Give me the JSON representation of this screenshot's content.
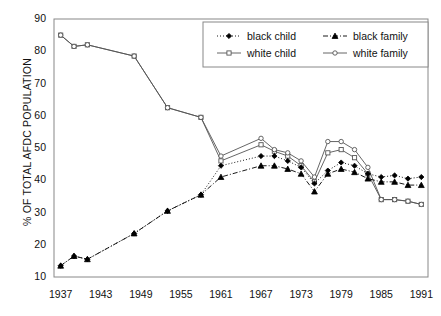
{
  "chart_data": {
    "type": "line",
    "title": "",
    "xlabel": "",
    "ylabel": "% OF TOTAL AFDC POPULATION",
    "xlim": [
      1936,
      1992
    ],
    "ylim": [
      10,
      90
    ],
    "grid": false,
    "legend_position": "top-right",
    "x_ticks": [
      1937,
      1943,
      1949,
      1955,
      1961,
      1967,
      1973,
      1979,
      1985,
      1991
    ],
    "y_ticks": [
      10,
      20,
      30,
      40,
      50,
      60,
      70,
      80,
      90
    ],
    "series": [
      {
        "name": "black child",
        "marker": "filled-diamond",
        "line_style": "dotted",
        "color": "#000000",
        "x": [
          1937,
          1939,
          1941,
          1948,
          1953,
          1958,
          1961,
          1967,
          1969,
          1971,
          1973,
          1975,
          1977,
          1979,
          1981,
          1983,
          1985,
          1987,
          1989,
          1991
        ],
        "y": [
          13.5,
          16.5,
          15.5,
          23.5,
          30.5,
          35.5,
          44.5,
          47.5,
          47.5,
          46.0,
          44.0,
          39.0,
          43.0,
          45.5,
          44.5,
          42.0,
          41.0,
          41.5,
          40.5,
          41.0
        ]
      },
      {
        "name": "black family",
        "marker": "filled-triangle",
        "line_style": "dash-dot",
        "color": "#000000",
        "x": [
          1937,
          1939,
          1941,
          1948,
          1953,
          1958,
          1961,
          1967,
          1969,
          1971,
          1973,
          1975,
          1977,
          1979,
          1981,
          1983,
          1985,
          1987,
          1989,
          1991
        ],
        "y": [
          13.5,
          16.5,
          15.5,
          23.5,
          30.5,
          35.5,
          41.0,
          44.5,
          44.5,
          43.5,
          42.0,
          36.5,
          42.0,
          43.5,
          42.5,
          40.5,
          39.5,
          39.5,
          38.5,
          38.5
        ]
      },
      {
        "name": "white child",
        "marker": "open-square",
        "line_style": "solid",
        "color": "#555555",
        "x": [
          1937,
          1939,
          1941,
          1948,
          1953,
          1958,
          1961,
          1967,
          1969,
          1971,
          1973,
          1975,
          1977,
          1979,
          1981,
          1983,
          1985,
          1987,
          1989,
          1991
        ],
        "y": [
          85.0,
          81.5,
          82.0,
          78.5,
          62.5,
          59.5,
          46.0,
          51.0,
          49.0,
          47.5,
          44.5,
          39.5,
          48.5,
          49.5,
          47.0,
          42.0,
          34.0,
          34.0,
          33.5,
          32.5
        ]
      },
      {
        "name": "white family",
        "marker": "open-circle",
        "line_style": "solid",
        "color": "#555555",
        "x": [
          1937,
          1939,
          1941,
          1948,
          1953,
          1958,
          1961,
          1967,
          1969,
          1971,
          1973,
          1975,
          1977,
          1979,
          1981,
          1983,
          1985,
          1987,
          1989,
          1991
        ],
        "y": [
          85.0,
          81.5,
          82.0,
          78.5,
          62.5,
          59.5,
          47.5,
          53.0,
          49.5,
          48.5,
          46.0,
          41.0,
          52.0,
          52.0,
          49.5,
          44.0,
          34.0,
          34.0,
          33.5,
          32.5
        ]
      }
    ],
    "legend": [
      {
        "label": "black child",
        "marker": "filled-diamond",
        "line_style": "dotted"
      },
      {
        "label": "black family",
        "marker": "filled-triangle",
        "line_style": "dash-dot"
      },
      {
        "label": "white child",
        "marker": "open-square",
        "line_style": "solid"
      },
      {
        "label": "white family",
        "marker": "open-circle",
        "line_style": "solid"
      }
    ]
  }
}
